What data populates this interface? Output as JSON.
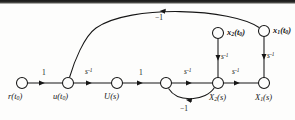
{
  "figure": {
    "kind": "signal-flow-graph",
    "background_color": "#fdfdfc",
    "line_color": "#161616",
    "width": 295,
    "height": 120
  },
  "nodes": [
    {
      "id": "r",
      "label_html": "r(t<sub>0</sub>)",
      "label_text": "r(t0)",
      "x": 22,
      "y": 83,
      "radius": 5.5,
      "label_dx": -10,
      "label_dy": 9,
      "bold": false
    },
    {
      "id": "u",
      "label_html": "u(t<sub>0</sub>)",
      "label_text": "u(t0)",
      "x": 68,
      "y": 83,
      "radius": 5.5,
      "label_dx": -11,
      "label_dy": 9,
      "bold": false
    },
    {
      "id": "U",
      "label_html": "U(s)",
      "label_text": "U(s)",
      "x": 117,
      "y": 83,
      "radius": 5.5,
      "label_dx": -11,
      "label_dy": 9,
      "bold": false
    },
    {
      "id": "n4",
      "label_html": "",
      "label_text": "",
      "x": 166,
      "y": 83,
      "radius": 5.5,
      "label_dx": 0,
      "label_dy": 0,
      "bold": false
    },
    {
      "id": "X2",
      "label_html": "X<sub>2</sub>(s)",
      "label_text": "X2(s)",
      "x": 218,
      "y": 83,
      "radius": 5.5,
      "label_dx": -9,
      "label_dy": 10,
      "bold": false
    },
    {
      "id": "X1",
      "label_html": "X<sub>1</sub>(s)",
      "label_text": "X1(s)",
      "x": 264,
      "y": 83,
      "radius": 5.5,
      "label_dx": -9,
      "label_dy": 10,
      "bold": false
    },
    {
      "id": "x2t",
      "label_html": "x<sub>2</sub>(t<sub>0</sub>)",
      "label_text": "x2(t0)",
      "x": 218,
      "y": 33,
      "radius": 5.5,
      "label_dx": 8,
      "label_dy": 3,
      "bold": true
    },
    {
      "id": "x1t",
      "label_html": "x<sub>1</sub>(t<sub>0</sub>)",
      "label_text": "x1(t0)",
      "x": 264,
      "y": 31,
      "radius": 5.5,
      "label_dx": 8,
      "label_dy": 3,
      "bold": true
    }
  ],
  "edges": [
    {
      "id": "r-u",
      "from": "r",
      "to": "u",
      "gain_html": "1",
      "gain_text": "1",
      "style": "straight",
      "label_x": 44,
      "label_y": 74
    },
    {
      "id": "u-U",
      "from": "u",
      "to": "U",
      "gain_html": "s<sup>-1</sup>",
      "gain_text": "s^-1",
      "style": "straight",
      "label_x": 90,
      "label_y": 74
    },
    {
      "id": "U-n4",
      "from": "U",
      "to": "n4",
      "gain_html": "1",
      "gain_text": "1",
      "style": "straight",
      "label_x": 141,
      "label_y": 74
    },
    {
      "id": "n4-X2",
      "from": "n4",
      "to": "X2",
      "gain_html": "s<sup>-1</sup>",
      "gain_text": "s^-1",
      "style": "straight",
      "label_x": 189,
      "label_y": 74
    },
    {
      "id": "X2-X1",
      "from": "X2",
      "to": "X1",
      "gain_html": "s<sup>-1</sup>",
      "gain_text": "s^-1",
      "style": "straight",
      "label_x": 237,
      "label_y": 74
    },
    {
      "id": "x2t-X2",
      "from": "x2t",
      "to": "X2",
      "gain_html": "s<sup>-1</sup>",
      "gain_text": "s^-1",
      "style": "vertical",
      "label_x": 222,
      "label_y": 57
    },
    {
      "id": "x1t-X1",
      "from": "x1t",
      "to": "X1",
      "gain_html": "s<sup>-1</sup>",
      "gain_text": "s^-1",
      "style": "vertical",
      "label_x": 268,
      "label_y": 57
    },
    {
      "id": "X2-n4-fb",
      "from": "X2",
      "to": "n4",
      "gain_html": "&minus;1",
      "gain_text": "-1",
      "style": "arc-below",
      "label_x": 186,
      "label_y": 104
    },
    {
      "id": "x1t-u-fb",
      "from": "x1t",
      "to": "u",
      "gain_html": "&minus;1",
      "gain_text": "-1",
      "style": "arc-above",
      "label_x": 160,
      "label_y": 18
    }
  ]
}
